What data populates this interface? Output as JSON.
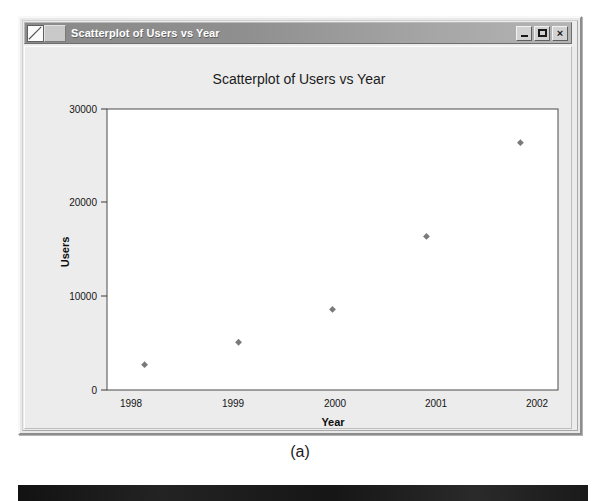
{
  "window": {
    "title": "Scatterplot of Users vs Year",
    "icon": "chart-document-icon",
    "buttons": {
      "minimize": "_",
      "maximize": "□",
      "close": "×"
    }
  },
  "caption": "(a)",
  "chart_data": {
    "type": "scatter",
    "title": "Scatterplot of Users vs Year",
    "xlabel": "Year",
    "ylabel": "Users",
    "x": [
      1998,
      1999,
      2000,
      2001,
      2002
    ],
    "values": [
      2700,
      5100,
      8600,
      16400,
      26400
    ],
    "xtick_labels": [
      "1998",
      "1999",
      "2000",
      "2001",
      "2002"
    ],
    "ytick_labels": [
      "0",
      "10000",
      "20000",
      "30000"
    ],
    "yticks": [
      0,
      10000,
      20000,
      30000
    ],
    "xlim": [
      1997.6,
      2002.4
    ],
    "ylim": [
      0,
      30000
    ],
    "grid": false,
    "legend": false,
    "marker": "diamond",
    "marker_color": "#7a7a7a",
    "plot_bg": "#ffffff",
    "frame_color": "#4a4a4a"
  }
}
